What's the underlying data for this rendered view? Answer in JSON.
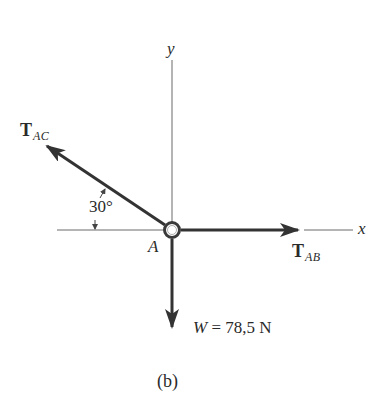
{
  "figure": {
    "caption": "(b)",
    "origin_label": "A",
    "axes": {
      "x_label": "x",
      "y_label": "y"
    },
    "forces": [
      {
        "id": "T_AC",
        "symbol": "T",
        "subscript": "AC",
        "direction": "up-left",
        "angle_from_negative_x_deg": 30
      },
      {
        "id": "T_AB",
        "symbol": "T",
        "subscript": "AB",
        "direction": "right"
      },
      {
        "id": "W",
        "symbol": "W",
        "direction": "down",
        "label": "W = 78,5 N",
        "magnitude": "78,5",
        "unit": "N"
      }
    ],
    "angle_annotation": "30°",
    "colors": {
      "line": "#3a3a3a",
      "axis": "#6a6a6a",
      "text": "#2a2a2a"
    }
  }
}
